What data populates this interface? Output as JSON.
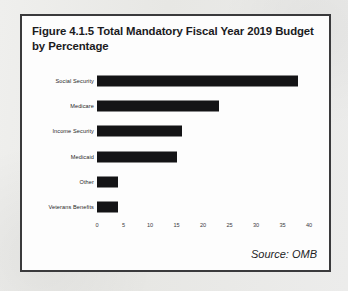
{
  "figure": {
    "title": "Figure 4.1.5 Total Mandatory Fiscal Year 2019 Budget by Percentage",
    "source_note": "Source: OMB",
    "border_color": "#3a3a3c",
    "bar_color": "#141416",
    "page_background": "#e9e9e7",
    "figure_background": "#fdfdfd"
  },
  "chart_data": {
    "type": "bar",
    "orientation": "horizontal",
    "title": "Figure 4.1.5 Total Mandatory Fiscal Year 2019 Budget by Percentage",
    "xlabel": "",
    "ylabel": "",
    "categories": [
      "Social Security",
      "Medicare",
      "Income Security",
      "Medicaid",
      "Other",
      "Veterans Benefits"
    ],
    "values": [
      38,
      23,
      16,
      15,
      4,
      4
    ],
    "xlim": [
      0,
      40
    ],
    "xticks": [
      0,
      5,
      10,
      15,
      20,
      25,
      30,
      35,
      40
    ],
    "xtick_labels": [
      "0",
      "5",
      "10",
      "15",
      "20",
      "25",
      "30",
      "35",
      "40"
    ],
    "grid": false,
    "legend": null,
    "annotations": [
      "Source: OMB"
    ]
  }
}
